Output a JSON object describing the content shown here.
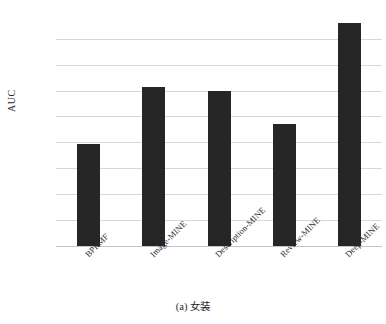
{
  "top_clipped_text": {
    "frag1": "·· ····",
    "frag2": "······· ·",
    "frag3": "··· ········",
    "frag4": "·····"
  },
  "caption": "(a) 女装",
  "colors": {
    "bar": "#262626",
    "gridline": "#d8d8d8",
    "text": "#2b2b2b",
    "background": "#ffffff"
  },
  "chart_data": {
    "type": "bar",
    "title": "",
    "subtitle": "",
    "xlabel": "",
    "ylabel": "AUC",
    "categories": [
      "BPRMF",
      "Image-MINE",
      "Description-MINE",
      "Review-MINE",
      "Deep-MINE"
    ],
    "values": [
      0.8195,
      0.8415,
      0.84,
      0.827,
      0.866
    ],
    "ylim": [
      0.78,
      0.868
    ],
    "yticks": [
      0.78,
      0.79,
      0.8,
      0.81,
      0.82,
      0.83,
      0.84,
      0.85,
      0.86
    ],
    "ytick_labels": [
      "0.78",
      "0.79",
      "0.80",
      "0.81",
      "0.82",
      "0.83",
      "0.84",
      "0.85",
      "0.86"
    ],
    "grid": true,
    "legend": false,
    "legend_position": "none",
    "bar_color": "#262626",
    "xtick_rotation": -45
  }
}
